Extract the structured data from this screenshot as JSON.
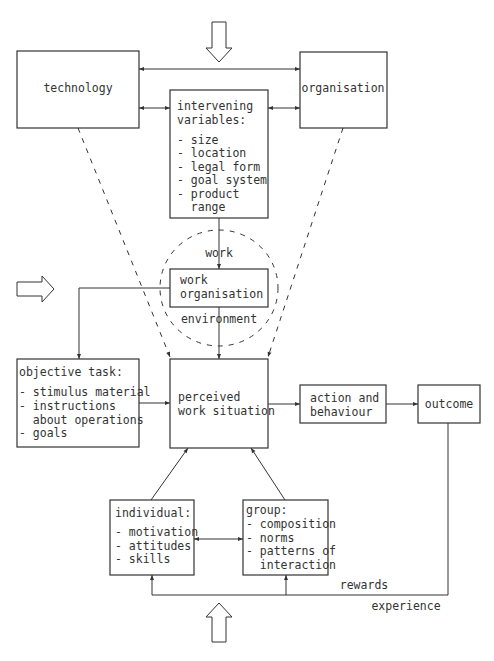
{
  "diagram": {
    "nodes": {
      "technology": {
        "label": "technology"
      },
      "organisation": {
        "label": "organisation"
      },
      "intervening": {
        "title_line1": "intervening",
        "title_line2": "variables:",
        "items": [
          "- size",
          "- location",
          "- legal form",
          "- goal system",
          "- product",
          "  range"
        ]
      },
      "work_organisation": {
        "line1": "work",
        "line2": "organisation"
      },
      "objective_task": {
        "title": "objective task:",
        "items": [
          "- stimulus material",
          "- instructions",
          "  about operations",
          "- goals"
        ]
      },
      "perceived": {
        "line1": "perceived",
        "line2": "work situation"
      },
      "action": {
        "line1": "action and",
        "line2": "behaviour"
      },
      "outcome": {
        "label": "outcome"
      },
      "individual": {
        "title": "individual:",
        "items": [
          "- motivation",
          "- attitudes",
          "- skills"
        ]
      },
      "group": {
        "title": "group:",
        "items": [
          "- composition",
          "- norms",
          "- patterns of",
          "  interaction"
        ]
      }
    },
    "edge_labels": {
      "work": "work",
      "environment": "environment",
      "rewards": "rewards",
      "experience": "experience"
    },
    "colors": {
      "stroke": "#333333",
      "background": "#ffffff"
    }
  }
}
